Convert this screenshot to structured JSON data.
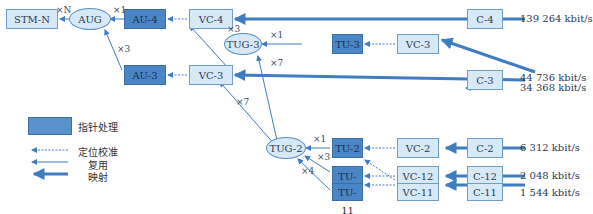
{
  "nodes": {
    "stm": "STM-N",
    "aug": "AUG",
    "au4": "AU-4",
    "au3": "AU-3",
    "vc4_left": "VC-4",
    "vc3_left": "VC-3",
    "tug3": "TUG-3",
    "tug2": "TUG-2",
    "tu3": "TU-3",
    "tu2": "TU-2",
    "tu12": "TU-12",
    "tu11": "TU-11",
    "vc3_right": "VC-3",
    "vc2": "VC-2",
    "vc12": "VC-12",
    "vc11": "VC-11",
    "c4": "C-4",
    "c3": "C-3",
    "c2": "C-2",
    "c12": "C-12",
    "c11": "C-11"
  },
  "multipliers": {
    "stm_aug": "×N",
    "aug_au4": "×1",
    "aug_au3": "×3",
    "vc4_tug3": "×3",
    "tug3_tu3": "×1",
    "tug3_tug2": "×7",
    "vc3_tug2": "×7",
    "tug2_tu2": "×1",
    "tug2_tu12": "×3",
    "tug2_tu11": "×4"
  },
  "rates": {
    "c4": "139 264 kbit/s",
    "c3_a": "44 736 kbit/s",
    "c3_b": "34 368 kbit/s",
    "c2": "6 312 kbit/s",
    "c12": "2 048 kbit/s",
    "c11": "1 544 kbit/s"
  },
  "legend": {
    "pointer": "指针处理",
    "alignment": "定位校准",
    "multiplexing": "复用",
    "mapping": "映射"
  },
  "colors": {
    "dark_box": "#4a86c5",
    "light_box": "#d6e9f7",
    "line": "#3f7dc0"
  }
}
